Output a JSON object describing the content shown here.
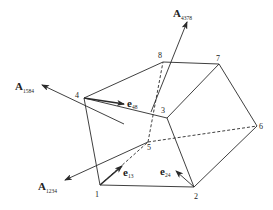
{
  "diagram": {
    "type": "hexahedron-element-with-face-normals",
    "nodes": [
      {
        "id": "1",
        "label": "1"
      },
      {
        "id": "2",
        "label": "2"
      },
      {
        "id": "3",
        "label": "3"
      },
      {
        "id": "4",
        "label": "4"
      },
      {
        "id": "5",
        "label": "5"
      },
      {
        "id": "6",
        "label": "6"
      },
      {
        "id": "7",
        "label": "7"
      },
      {
        "id": "8",
        "label": "8"
      }
    ],
    "edges_solid": [
      [
        "1",
        "2"
      ],
      [
        "1",
        "4"
      ],
      [
        "4",
        "3"
      ],
      [
        "3",
        "2"
      ],
      [
        "4",
        "8"
      ],
      [
        "8",
        "7"
      ],
      [
        "7",
        "3"
      ],
      [
        "7",
        "6"
      ],
      [
        "6",
        "2"
      ]
    ],
    "edges_dashed": [
      [
        "1",
        "5"
      ],
      [
        "5",
        "8"
      ],
      [
        "5",
        "6"
      ]
    ],
    "area_vectors": [
      {
        "id": "A1584",
        "symbol": "A",
        "subscript": "1584"
      },
      {
        "id": "A4378",
        "symbol": "A",
        "subscript": "4378"
      },
      {
        "id": "A1234",
        "symbol": "A",
        "subscript": "1234"
      }
    ],
    "unit_vectors": [
      {
        "id": "e48",
        "symbol": "e",
        "subscript": "48"
      },
      {
        "id": "e13",
        "symbol": "e",
        "subscript": "13"
      },
      {
        "id": "e24",
        "symbol": "e",
        "subscript": "24"
      }
    ]
  }
}
